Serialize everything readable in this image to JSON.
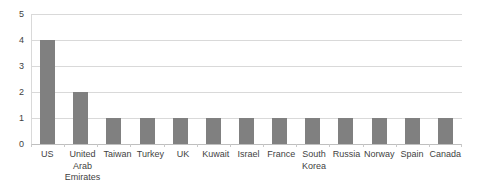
{
  "chart_data": {
    "type": "bar",
    "title": "",
    "subtitle": "",
    "xlabel": "",
    "ylabel": "",
    "categories": [
      "US",
      "United Arab Emirates",
      "Taiwan",
      "Turkey",
      "UK",
      "Kuwait",
      "Israel",
      "France",
      "South Korea",
      "Russia",
      "Norway",
      "Spain",
      "Canada"
    ],
    "values": [
      4,
      2,
      1,
      1,
      1,
      1,
      1,
      1,
      1,
      1,
      1,
      1,
      1
    ],
    "series": [
      {
        "name": "",
        "values": [
          4,
          2,
          1,
          1,
          1,
          1,
          1,
          1,
          1,
          1,
          1,
          1,
          1
        ]
      }
    ],
    "ylim": [
      0,
      5
    ],
    "ytick_labels": [
      "0",
      "1",
      "2",
      "3",
      "4",
      "5"
    ],
    "ytick_values": [
      0,
      1,
      2,
      3,
      4,
      5
    ],
    "grid": true,
    "grid_axis": "y",
    "legend": false,
    "legend_position": "none",
    "bar_color": "#808080",
    "gridline_color": "#d9d9d9",
    "axis_color": "#bfbfbf",
    "background_color": "#ffffff",
    "text_color": "#3f3f3f"
  }
}
